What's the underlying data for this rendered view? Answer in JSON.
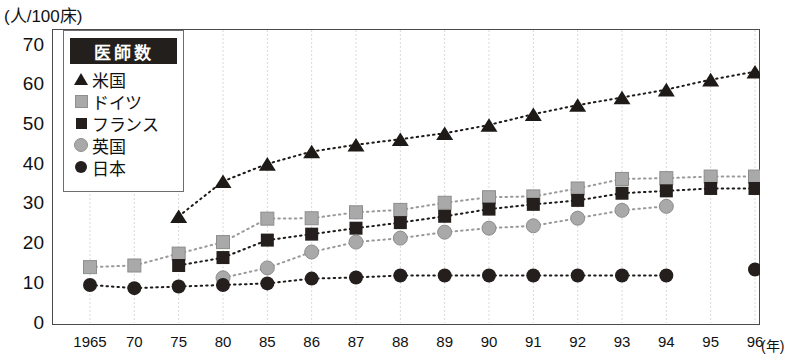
{
  "axis_unit_label": "(人/100床)",
  "x_unit_label": "(年)",
  "legend": {
    "title": "医師数",
    "items": [
      {
        "label": "米国",
        "marker": "triangle-up-icon",
        "color": "#1d1a18"
      },
      {
        "label": "ドイツ",
        "marker": "square-light-icon",
        "color": "#a9a9a9"
      },
      {
        "label": "フランス",
        "marker": "square-dark-icon",
        "color": "#241f1d"
      },
      {
        "label": "英国",
        "marker": "circle-light-icon",
        "color": "#a9a9a9"
      },
      {
        "label": "日本",
        "marker": "circle-dark-icon",
        "color": "#241f1d"
      }
    ]
  },
  "y_ticks": [
    "70",
    "60",
    "50",
    "40",
    "30",
    "20",
    "10",
    "0"
  ],
  "x_ticks": [
    "1965",
    "70",
    "75",
    "80",
    "85",
    "86",
    "87",
    "88",
    "89",
    "90",
    "91",
    "92",
    "93",
    "94",
    "95",
    "96"
  ],
  "chart_data": {
    "type": "line",
    "title": "医師数",
    "xlabel": "(年)",
    "ylabel": "(人/100床)",
    "ylim": [
      0,
      70
    ],
    "ytick_step": 10,
    "grid": true,
    "grid_axis": "x",
    "legend_position": "top-left-inside",
    "categories": [
      "1965",
      "70",
      "75",
      "80",
      "85",
      "86",
      "87",
      "88",
      "89",
      "90",
      "91",
      "92",
      "93",
      "94",
      "95",
      "96"
    ],
    "series": [
      {
        "name": "米国",
        "marker": "triangle",
        "color": "#1d1a18",
        "values": [
          null,
          null,
          27,
          35.8,
          40.2,
          43.3,
          45,
          46.4,
          47.9,
          50,
          52.7,
          55,
          56.9,
          58.9,
          61.4,
          63.4
        ]
      },
      {
        "name": "ドイツ",
        "marker": "square-light",
        "color": "#a9a9a9",
        "values": [
          14.2,
          14.6,
          17.6,
          20.5,
          26.4,
          26.5,
          28,
          28.6,
          30.4,
          31.8,
          32,
          34,
          36.4,
          36.6,
          37,
          37
        ]
      },
      {
        "name": "フランス",
        "marker": "square-dark",
        "color": "#241f1d",
        "values": [
          null,
          null,
          14.6,
          16.6,
          21,
          22.5,
          24,
          25.4,
          27,
          28.8,
          30,
          31,
          32.8,
          33.4,
          34,
          34
        ]
      },
      {
        "name": "英国",
        "marker": "circle-light",
        "color": "#a9a9a9",
        "values": [
          null,
          null,
          null,
          11.5,
          14,
          18,
          20.5,
          21.5,
          23,
          24,
          24.6,
          26.5,
          28.5,
          29.5,
          null,
          null
        ]
      },
      {
        "name": "日本",
        "marker": "circle-dark",
        "color": "#241f1d",
        "values": [
          9.7,
          8.9,
          9.3,
          9.7,
          10.1,
          11.3,
          11.6,
          12.1,
          12.1,
          12.1,
          12.1,
          12.1,
          12.1,
          12.1,
          null,
          13.6
        ]
      }
    ]
  }
}
